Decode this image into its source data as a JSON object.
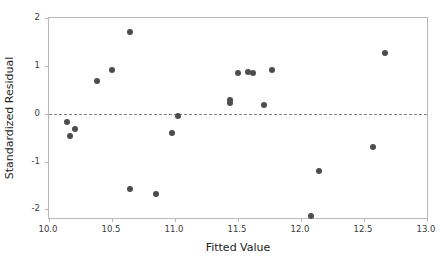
{
  "chart_data": {
    "type": "scatter",
    "title": "",
    "xlabel": "Fitted Value",
    "ylabel": "Standardized Residual",
    "xlim": [
      10.0,
      13.0
    ],
    "ylim": [
      -2.18,
      2.0
    ],
    "xticks": [
      "10.0",
      "10.5",
      "11.0",
      "11.5",
      "12.0",
      "12.5",
      "13.0"
    ],
    "xtick_values": [
      10.0,
      10.5,
      11.0,
      11.5,
      12.0,
      12.5,
      13.0
    ],
    "yticks": [
      "2",
      "1",
      "0",
      "-1",
      "-2"
    ],
    "ytick_values": [
      2,
      1,
      0,
      -1,
      -2
    ],
    "grid": false,
    "legend": null,
    "reference_lines": [
      {
        "axis": "y",
        "value": 0,
        "style": "dashed",
        "color": "#808080"
      }
    ],
    "marker": {
      "shape": "circle",
      "color": "#4d4d4d",
      "size_px": 6
    },
    "series": [
      {
        "name": "Residuals",
        "x": [
          10.14,
          10.17,
          10.21,
          10.38,
          10.5,
          10.64,
          10.64,
          10.85,
          10.98,
          11.02,
          11.44,
          11.44,
          11.5,
          11.58,
          11.62,
          11.71,
          11.77,
          12.08,
          12.14,
          12.57,
          12.67
        ],
        "y": [
          -0.18,
          -0.46,
          -0.31,
          0.69,
          0.91,
          1.7,
          -1.58,
          -1.67,
          -0.41,
          -0.04,
          0.22,
          0.29,
          0.85,
          0.87,
          0.86,
          0.19,
          0.92,
          -2.13,
          -1.19,
          -0.69,
          1.27
        ]
      }
    ]
  },
  "axis_colors": {
    "frame": "#b9b9b9",
    "tick_text": "#3a3a3a",
    "axis_title": "#222222",
    "point": "#4d4d4d",
    "reference_line": "#808080"
  }
}
